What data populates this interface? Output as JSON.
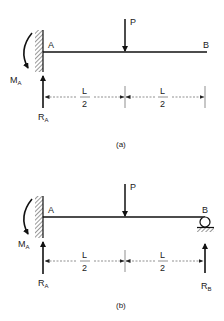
{
  "diagrams": [
    {
      "id": "a",
      "caption": "(a)",
      "support_left": "fixed-wall",
      "support_right": "free",
      "labels": {
        "left_point": "A",
        "right_point": "B",
        "load": "P",
        "moment": "M",
        "moment_sub": "A",
        "reaction_left": "R",
        "reaction_left_sub": "A",
        "dim_left_num": "L",
        "dim_left_den": "2",
        "dim_right_num": "L",
        "dim_right_den": "2"
      }
    },
    {
      "id": "b",
      "caption": "(b)",
      "support_left": "fixed-wall",
      "support_right": "roller",
      "labels": {
        "left_point": "A",
        "right_point": "B",
        "load": "P",
        "moment": "M",
        "moment_sub": "A",
        "reaction_left": "R",
        "reaction_left_sub": "A",
        "reaction_right": "R",
        "reaction_right_sub": "B",
        "dim_left_num": "L",
        "dim_left_den": "2",
        "dim_right_num": "L",
        "dim_right_den": "2"
      }
    }
  ]
}
